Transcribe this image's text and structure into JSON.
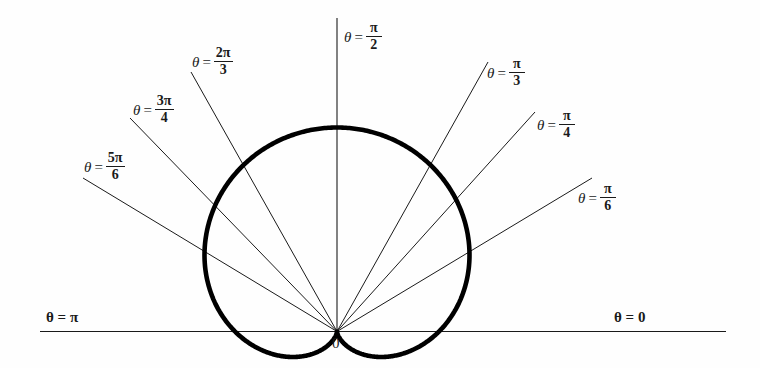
{
  "figure": {
    "kind": "polar-plot",
    "background_color": "#fefefe",
    "ink_color": "#1a1a1a",
    "curve_color": "#000000",
    "pole_label": "0"
  },
  "axes": {
    "polar_axis_label_right": "θ = 0",
    "polar_axis_label_left": "θ = π",
    "vertical_axis_label_theta": "θ",
    "vertical_axis_label_eq": "=",
    "vertical_axis_num": "π",
    "vertical_axis_den": "2"
  },
  "rays": [
    {
      "name": "ray-pi-over-6",
      "theta_deg": 30,
      "theta": "θ",
      "eq": "=",
      "num": "π",
      "den": "6",
      "label_x": 578,
      "label_y": 183
    },
    {
      "name": "ray-pi-over-4",
      "theta_deg": 45,
      "theta": "θ",
      "eq": "=",
      "num": "π",
      "den": "4",
      "label_x": 537,
      "label_y": 110
    },
    {
      "name": "ray-pi-over-3",
      "theta_deg": 60,
      "theta": "θ",
      "eq": "=",
      "num": "π",
      "den": "3",
      "label_x": 487,
      "label_y": 58
    },
    {
      "name": "ray-pi-over-2",
      "theta_deg": 90,
      "theta": "θ",
      "eq": "=",
      "num": "π",
      "den": "2",
      "label_x": 344,
      "label_y": 22
    },
    {
      "name": "ray-2pi-over-3",
      "theta_deg": 120,
      "theta": "θ",
      "eq": "=",
      "num": "2π",
      "den": "3",
      "label_x": 192,
      "label_y": 47
    },
    {
      "name": "ray-3pi-over-4",
      "theta_deg": 135,
      "theta": "θ",
      "eq": "=",
      "num": "3π",
      "den": "4",
      "label_x": 133,
      "label_y": 95
    },
    {
      "name": "ray-5pi-over-6",
      "theta_deg": 150,
      "theta": "θ",
      "eq": "=",
      "num": "5π",
      "den": "6",
      "label_x": 84,
      "label_y": 152
    }
  ],
  "chart_data": {
    "type": "line",
    "plot_system": "polar",
    "title": "",
    "xlabel": "",
    "ylabel": "",
    "grid": false,
    "legend": null,
    "curve": {
      "name": "cardioid",
      "equation": "r = a(1 + sin θ)",
      "description": "Cardioid with cusp at the pole pointing downward; maximum radius along θ = π/2.",
      "a": 1,
      "r_max": 2,
      "r_min": 0,
      "theta_range_deg": [
        0,
        360
      ],
      "sample_points_deg_r": [
        [
          0,
          1.0
        ],
        [
          30,
          1.5
        ],
        [
          45,
          1.707
        ],
        [
          60,
          1.866
        ],
        [
          90,
          2.0
        ],
        [
          120,
          1.866
        ],
        [
          135,
          1.707
        ],
        [
          150,
          1.5
        ],
        [
          180,
          1.0
        ],
        [
          210,
          0.5
        ],
        [
          225,
          0.293
        ],
        [
          240,
          0.134
        ],
        [
          270,
          0.0
        ],
        [
          300,
          0.134
        ],
        [
          315,
          0.293
        ],
        [
          330,
          0.5
        ],
        [
          360,
          1.0
        ]
      ]
    },
    "reference_rays_deg": [
      0,
      30,
      45,
      60,
      90,
      120,
      135,
      150,
      180
    ],
    "pole_marker": "0",
    "axis_tick_labels": [
      "θ = 0",
      "θ = π/6",
      "θ = π/4",
      "θ = π/3",
      "θ = π/2",
      "θ = 2π/3",
      "θ = 3π/4",
      "θ = 5π/6",
      "θ = π"
    ]
  }
}
